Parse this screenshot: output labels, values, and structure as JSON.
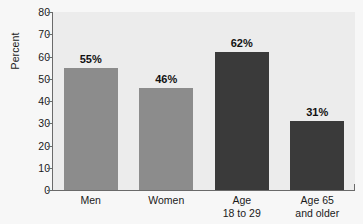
{
  "chart_data": {
    "type": "bar",
    "title": "",
    "subtitle": "",
    "xlabel": "",
    "ylabel": "Percent",
    "ylim": [
      0,
      80
    ],
    "ytick_step": 10,
    "yticks": [
      80,
      70,
      60,
      50,
      40,
      30,
      20,
      10,
      0
    ],
    "grid": false,
    "legend": null,
    "orientation": "vertical",
    "categories": [
      "Men",
      "Women",
      "Age 18 to 29",
      "Age 65 and older"
    ],
    "category_lines": [
      {
        "line1": "Men",
        "line2": ""
      },
      {
        "line1": "Women",
        "line2": ""
      },
      {
        "line1": "Age",
        "line2": "18 to 29"
      },
      {
        "line1": "Age 65",
        "line2": "and older"
      }
    ],
    "values": [
      55,
      46,
      62,
      31
    ],
    "value_labels": [
      "55%",
      "46%",
      "62%",
      "31%"
    ],
    "bar_colors": [
      "#8c8c8c",
      "#8c8c8c",
      "#3a3a3a",
      "#3a3a3a"
    ],
    "series": [
      {
        "name": "Percent",
        "values": [
          55,
          46,
          62,
          31
        ]
      }
    ]
  },
  "style": {
    "page_background": "#f7f7f7",
    "plot_background": "#ececec",
    "axis_color": "#6a6a6a",
    "text_color": "#1a1a1a",
    "label_color": "#111111",
    "bar_light": "#8c8c8c",
    "bar_dark": "#3a3a3a"
  }
}
